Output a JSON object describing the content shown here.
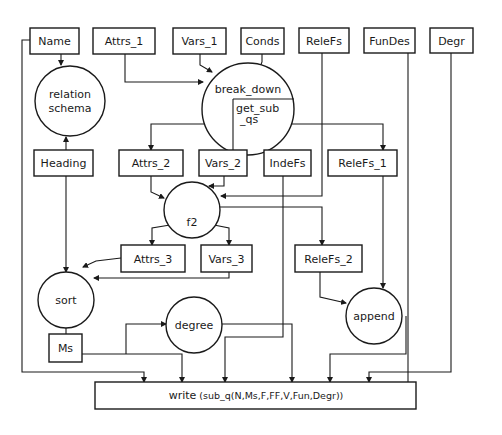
{
  "diagram": {
    "type": "data-flow diagram",
    "boxes": {
      "name": "Name",
      "attrs_1": "Attrs_1",
      "vars_1": "Vars_1",
      "conds": "Conds",
      "relefs": "ReleFs",
      "fundes": "FunDes",
      "degr": "Degr",
      "heading": "Heading",
      "attrs_2": "Attrs_2",
      "vars_2": "Vars_2",
      "indefs": "IndeFs",
      "relefs_1": "ReleFs_1",
      "attrs_3": "Attrs_3",
      "vars_3": "Vars_3",
      "relefs_2": "ReleFs_2",
      "ms": "Ms",
      "write_prefix": "write",
      "write_args": "(sub_q(N,Ms,F,FF,V,Fun,Degr))"
    },
    "processes": {
      "relation_schema_line1": "relation",
      "relation_schema_line2": "schema",
      "break_down": "break_down",
      "get_sub_qs_line1": "get_sub",
      "get_sub_qs_line2": "_qs",
      "f2": "f2",
      "sort": "sort",
      "degree": "degree",
      "append": "append"
    },
    "edges": [
      {
        "from": "Name",
        "to": "relation schema"
      },
      {
        "from": "Heading",
        "to": "relation schema"
      },
      {
        "from": "Attrs_1",
        "to": "break_down"
      },
      {
        "from": "Vars_1",
        "to": "break_down"
      },
      {
        "from": "Conds",
        "to": "break_down"
      },
      {
        "from": "break_down",
        "to": "Attrs_2"
      },
      {
        "from": "break_down",
        "to": "ReleFs_1"
      },
      {
        "from": "Attrs_2",
        "to": "f2"
      },
      {
        "from": "Vars_2",
        "to": "f2"
      },
      {
        "from": "ReleFs",
        "to": "f2"
      },
      {
        "from": "f2",
        "to": "Attrs_3"
      },
      {
        "from": "f2",
        "to": "Vars_3"
      },
      {
        "from": "f2",
        "to": "ReleFs_2"
      },
      {
        "from": "Heading",
        "to": "sort"
      },
      {
        "from": "Attrs_3",
        "to": "sort"
      },
      {
        "from": "Vars_3",
        "to": "sort"
      },
      {
        "from": "Ms",
        "to": "sort"
      },
      {
        "from": "Ms",
        "to": "degree"
      },
      {
        "from": "ReleFs_1",
        "to": "append"
      },
      {
        "from": "ReleFs_2",
        "to": "append"
      },
      {
        "from": "Name",
        "to": "write"
      },
      {
        "from": "Ms",
        "to": "write"
      },
      {
        "from": "IndeFs",
        "to": "write"
      },
      {
        "from": "degree",
        "to": "write"
      },
      {
        "from": "append",
        "to": "write"
      },
      {
        "from": "FunDes",
        "to": "write"
      },
      {
        "from": "Degr",
        "to": "write"
      }
    ]
  }
}
